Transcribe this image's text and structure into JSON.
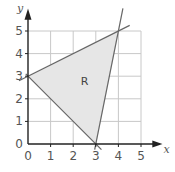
{
  "chart_data": {
    "type": "diagram",
    "title": "",
    "xlabel": "x",
    "ylabel": "y",
    "xlim": [
      0,
      5
    ],
    "ylim": [
      0,
      5
    ],
    "grid": true,
    "x_ticks": [
      "0",
      "1",
      "2",
      "3",
      "4",
      "5"
    ],
    "y_ticks": [
      "0",
      "1",
      "2",
      "3",
      "4",
      "5"
    ],
    "lines": [
      {
        "name": "line-a",
        "equation": "y = x/2 + 3",
        "from": [
          -0.4,
          2.8
        ],
        "to": [
          4.5,
          5.25
        ]
      },
      {
        "name": "line-b",
        "equation": "y = -x + 3",
        "from": [
          -0.1,
          3.1
        ],
        "to": [
          3.25,
          -0.25
        ]
      },
      {
        "name": "line-c",
        "equation": "y = 5x - 15",
        "from": [
          2.95,
          -0.25
        ],
        "to": [
          4.2,
          6.0
        ]
      }
    ],
    "region": {
      "label": "R",
      "vertices": [
        [
          0,
          3
        ],
        [
          4,
          5
        ],
        [
          3,
          0
        ]
      ],
      "label_position": [
        2.5,
        2.6
      ],
      "fill": "#e6e6e6"
    }
  },
  "colors": {
    "grid": "#c8c8c8",
    "axis": "#222222",
    "line": "#666666",
    "region_fill": "#e6e6e6"
  }
}
